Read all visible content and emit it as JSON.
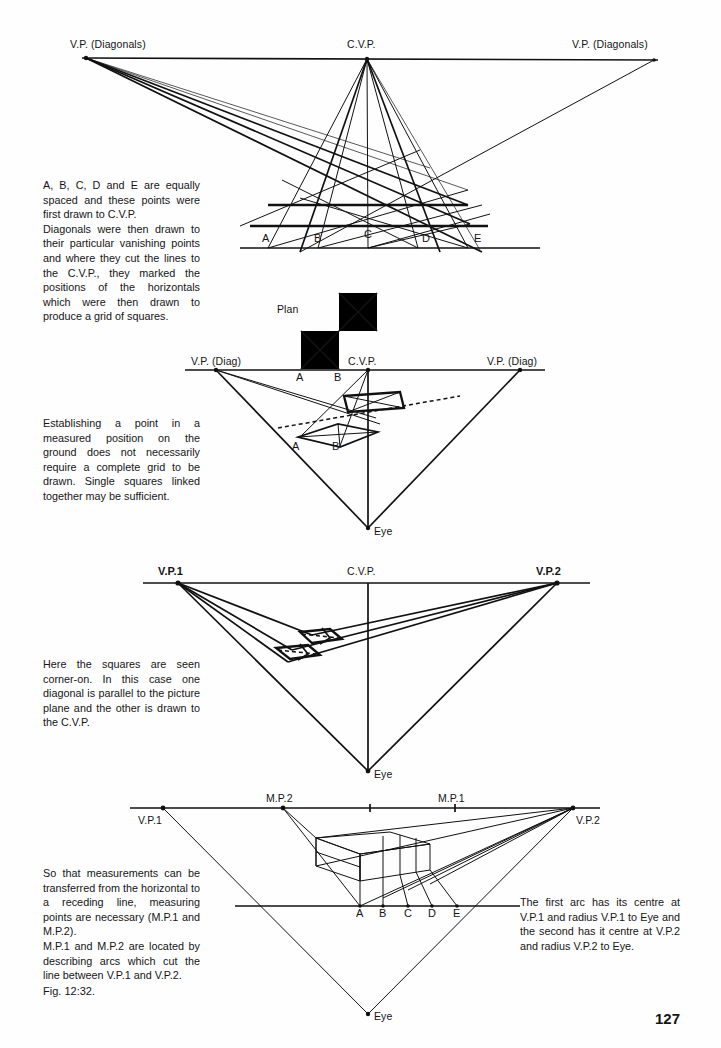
{
  "page": {
    "number": "127",
    "figure_caption": "Fig. 12:32."
  },
  "figures": [
    {
      "id": "grid-of-squares",
      "labels": {
        "vp_left": "V.P. (Diagonals)",
        "cvp": "C.V.P.",
        "vp_right": "V.P. (Diagonals)",
        "points": [
          "A",
          "B",
          "C",
          "D",
          "E"
        ]
      },
      "caption_paragraphs": [
        "A, B, C, D and E are equally spaced and these points were first drawn to C.V.P.",
        "Diagonals were then drawn to their particular vanishing points and where they cut the lines to the C.V.P., they marked the positions of the horizontals which were then drawn to produce a grid of squares."
      ]
    },
    {
      "id": "single-squares-linked",
      "labels": {
        "plan": "Plan",
        "vp_left": "V.P. (Diag)",
        "cvp": "C.V.P.",
        "vp_right": "V.P. (Diag)",
        "eye": "Eye",
        "plan_points": [
          "A",
          "B"
        ],
        "persp_points": [
          "A",
          "B"
        ]
      },
      "caption_paragraphs": [
        "Establishing a point in a measured position on the ground does not necessarily require a complete grid to be drawn. Single squares linked together may be sufficient."
      ]
    },
    {
      "id": "squares-corner-on",
      "labels": {
        "vp1": "V.P.1",
        "cvp": "C.V.P.",
        "vp2": "V.P.2",
        "eye": "Eye"
      },
      "caption_paragraphs": [
        "Here the squares are seen corner-on. In this case one diagonal is parallel to the picture plane and the other is drawn to the C.V.P."
      ]
    },
    {
      "id": "measuring-points",
      "labels": {
        "vp1": "V.P.1",
        "mp2": "M.P.2",
        "mp1": "M.P.1",
        "vp2": "V.P.2",
        "eye": "Eye",
        "points": [
          "A",
          "B",
          "C",
          "D",
          "E"
        ]
      },
      "caption_paragraphs": [
        "So that measurements can be transferred from the horizontal to a receding line, measuring points are necessary (M.P.1 and M.P.2).",
        "M.P.1 and M.P.2 are located by describing arcs which cut the line between V.P.1 and V.P.2."
      ],
      "caption_right_paragraphs": [
        "The first arc has its centre at V.P.1 and radius V.P.1 to Eye and the second has it centre at V.P.2 and radius V.P.2 to Eye."
      ]
    }
  ],
  "colors": {
    "ink": "#111111",
    "paper": "#fefefe"
  }
}
